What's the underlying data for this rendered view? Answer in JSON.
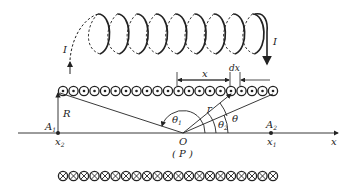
{
  "figure": {
    "type": "solenoid-magnetic-field-diagram",
    "colors": {
      "ink": "#222222",
      "background": "#ffffff"
    }
  },
  "coil": {
    "loop_count": 9,
    "current_in_label": "I",
    "current_out_label": "I"
  },
  "cross_section": {
    "top_row": {
      "symbol": "dot-in-circle",
      "count": 21
    },
    "bottom_row": {
      "symbol": "cross-in-circle",
      "count": 21
    }
  },
  "labels": {
    "radius": "R",
    "distance": "r",
    "position": "x",
    "element": "dx",
    "theta": "θ",
    "theta1": "θ",
    "theta1_sub": "1",
    "theta2": "θ",
    "theta2_sub": "2",
    "point_a1": "A",
    "point_a1_sub": "1",
    "point_a2": "A",
    "point_a2_sub": "2",
    "coord_x2": "x",
    "coord_x2_sub": "2",
    "coord_x1": "x",
    "coord_x1_sub": "1",
    "origin": "O",
    "origin_alias": "( P )",
    "axis": "x"
  }
}
